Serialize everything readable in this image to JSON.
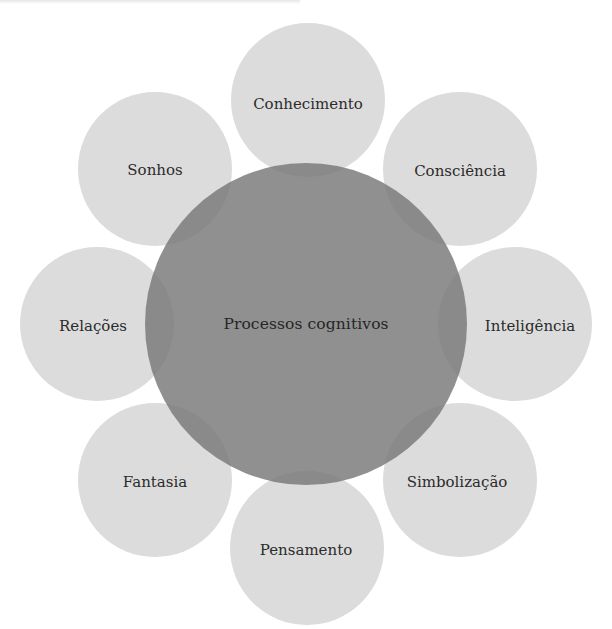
{
  "diagram": {
    "center": {
      "label": "Processos cognitivos"
    },
    "satellites": [
      {
        "label": "Conhecimento",
        "position": "top"
      },
      {
        "label": "Consciência",
        "position": "top-right"
      },
      {
        "label": "Inteligência",
        "position": "right"
      },
      {
        "label": "Simbolização",
        "position": "bottom-right"
      },
      {
        "label": "Pensamento",
        "position": "bottom"
      },
      {
        "label": "Fantasia",
        "position": "bottom-left"
      },
      {
        "label": "Relações",
        "position": "left"
      },
      {
        "label": "Sonhos",
        "position": "top-left"
      }
    ],
    "colors": {
      "satellite_fill": "#dcdcdc",
      "center_fill": "#7a7a7a",
      "overlap_fill": "#6a6a6a",
      "text": "#2b2b2b"
    }
  }
}
